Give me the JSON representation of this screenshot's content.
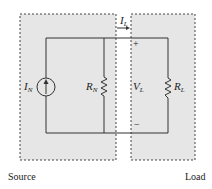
{
  "diagram": {
    "boxes": {
      "source": {
        "label": "Source"
      },
      "load": {
        "label": "Load"
      }
    },
    "components": {
      "current_source": {
        "symbol": "I",
        "subscript": "N"
      },
      "norton_resistor": {
        "symbol": "R",
        "subscript": "N"
      },
      "load_resistor": {
        "symbol": "R",
        "subscript": "L"
      },
      "load_voltage": {
        "symbol": "V",
        "subscript": "L",
        "plus": "+",
        "minus": "−"
      },
      "load_current": {
        "symbol": "I",
        "subscript": "L",
        "arrow": "→"
      }
    },
    "colors": {
      "box_fill": "#e6e6e6",
      "wire": "#333333",
      "dash": "#444444"
    }
  }
}
